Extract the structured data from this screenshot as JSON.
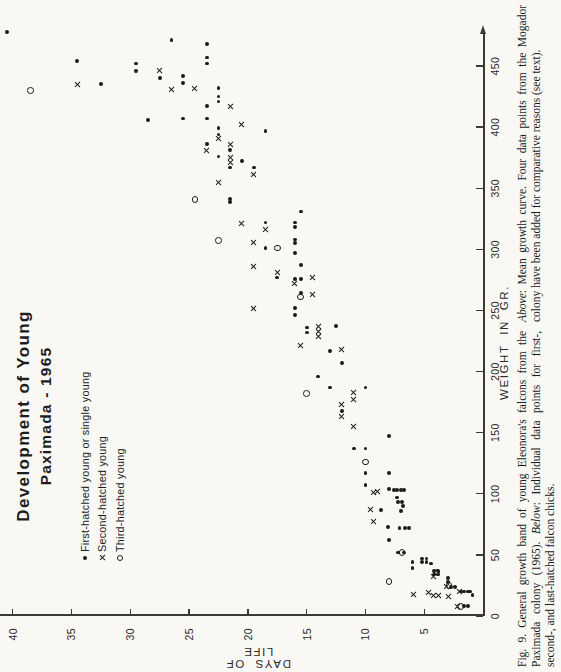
{
  "figure": {
    "title_line1": "Development of Young",
    "title_line2": "Paximada - 1965",
    "legend": [
      {
        "marker": "dot",
        "label": "First-hatched young or single young"
      },
      {
        "marker": "x",
        "label": "Second-hatched young"
      },
      {
        "marker": "circle",
        "label": "Third-hatched young"
      }
    ],
    "x_axis_label": "WEIGHT  IN  GR.",
    "y_axis_label": "DAYS  OF  LIFE"
  },
  "captions": {
    "left": [
      {
        "t": "Fig. 9. General growth band of young Eleonora's falcons from the Paximada colony (1965). ",
        "i": false
      },
      {
        "t": "Below",
        "i": true
      },
      {
        "t": ": Individual data points for first-, second-, and last-hatched falcon chicks.",
        "i": false
      }
    ],
    "right": [
      {
        "t": "Above",
        "i": true
      },
      {
        "t": ": Mean growth curve. Four data points from the Mogador colony have been added for comparative reasons (see text).",
        "i": false
      }
    ]
  },
  "chart_data": {
    "type": "scatter",
    "xlabel": "WEIGHT IN GR.",
    "ylabel": "DAYS OF LIFE",
    "xlim": [
      0,
      480
    ],
    "ylim": [
      0,
      41
    ],
    "x_ticks": [
      0,
      50,
      100,
      150,
      200,
      250,
      300,
      350,
      400,
      450
    ],
    "y_ticks": [
      5,
      10,
      15,
      20,
      25,
      30,
      35,
      40
    ],
    "grid": false,
    "legend_position": "upper-left",
    "layout_note": "figure printed rotated 90° counter-clockwise on the page; weight axis ends in an arrow",
    "axis_map": {
      "weight_px0": 56,
      "weight_px_per_unit": 1.2222,
      "days_px0": 483,
      "days_px_per_unit": 11.758
    },
    "marker_color": "#1c1c1c",
    "series": [
      {
        "name": "First-hatched young or single young",
        "marker": "dot",
        "points_weight_day": [
          [
            478,
            40.5
          ],
          [
            471,
            26.5
          ],
          [
            468,
            23.5
          ],
          [
            457,
            23.5
          ],
          [
            454,
            34.5
          ],
          [
            452,
            29.5
          ],
          [
            452,
            23.5
          ],
          [
            446,
            29.5
          ],
          [
            442,
            25.5
          ],
          [
            440,
            27.5
          ],
          [
            436,
            25.5
          ],
          [
            435,
            32.5
          ],
          [
            432,
            22.5
          ],
          [
            425,
            22.5
          ],
          [
            421,
            22.5
          ],
          [
            417,
            23.5
          ],
          [
            407,
            25.5
          ],
          [
            407,
            23.5
          ],
          [
            406,
            28.5
          ],
          [
            399,
            22.5
          ],
          [
            397,
            18.5
          ],
          [
            394,
            22.5
          ],
          [
            386,
            23.5
          ],
          [
            381,
            21.5
          ],
          [
            376,
            22.5
          ],
          [
            372,
            20.5
          ],
          [
            367,
            21.5
          ],
          [
            367,
            19.5
          ],
          [
            341,
            21.5
          ],
          [
            339,
            21.5
          ],
          [
            331,
            15.5
          ],
          [
            322,
            18.5
          ],
          [
            322,
            16
          ],
          [
            318,
            16
          ],
          [
            308,
            16
          ],
          [
            305,
            16
          ],
          [
            301,
            18.5
          ],
          [
            297,
            16
          ],
          [
            287,
            15.5
          ],
          [
            277,
            17.5
          ],
          [
            276,
            16
          ],
          [
            276,
            15.5
          ],
          [
            264,
            15.5
          ],
          [
            252,
            16
          ],
          [
            246,
            16
          ],
          [
            237,
            12.5
          ],
          [
            236,
            15
          ],
          [
            232,
            15
          ],
          [
            217,
            13
          ],
          [
            207,
            12
          ],
          [
            196,
            14
          ],
          [
            187,
            13
          ],
          [
            187,
            10
          ],
          [
            168,
            12
          ],
          [
            147,
            8
          ],
          [
            137,
            11
          ],
          [
            137,
            10
          ],
          [
            117,
            10
          ],
          [
            117,
            8
          ],
          [
            107,
            10
          ],
          [
            104,
            8
          ],
          [
            103,
            7.6
          ],
          [
            103,
            7.3
          ],
          [
            103,
            7
          ],
          [
            103,
            6.7
          ],
          [
            97,
            7.3
          ],
          [
            93,
            7.2
          ],
          [
            93,
            6.9
          ],
          [
            90,
            6.8
          ],
          [
            87,
            8.7
          ],
          [
            86,
            7
          ],
          [
            73,
            8.1
          ],
          [
            72,
            7.1
          ],
          [
            72,
            6.6
          ],
          [
            72,
            6.3
          ],
          [
            62,
            8
          ],
          [
            52,
            7.2
          ],
          [
            52,
            6.7
          ],
          [
            44,
            6
          ],
          [
            39,
            6
          ],
          [
            47,
            5.2
          ],
          [
            47,
            4.8
          ],
          [
            44,
            5.2
          ],
          [
            44,
            4.8
          ],
          [
            43,
            4.4
          ],
          [
            37,
            4.2
          ],
          [
            37,
            3.8
          ],
          [
            34,
            4.2
          ],
          [
            34,
            3.8
          ],
          [
            31,
            3
          ],
          [
            28,
            3
          ],
          [
            24,
            2.7
          ],
          [
            24,
            2.4
          ],
          [
            20,
            1.9
          ],
          [
            20,
            1.6
          ],
          [
            20,
            1.3
          ],
          [
            20,
            1.1
          ],
          [
            17,
            0.9
          ],
          [
            8,
            1.6
          ],
          [
            8,
            1.3
          ]
        ]
      },
      {
        "name": "Second-hatched young",
        "marker": "x",
        "points_weight_day": [
          [
            446,
            27.5
          ],
          [
            435,
            34.5
          ],
          [
            432,
            24.5
          ],
          [
            431,
            26.5
          ],
          [
            417,
            21.5
          ],
          [
            402,
            20.5
          ],
          [
            391,
            22.5
          ],
          [
            386,
            21.5
          ],
          [
            381,
            23.5
          ],
          [
            375,
            21.5
          ],
          [
            371,
            21.5
          ],
          [
            361,
            19.5
          ],
          [
            355,
            22.5
          ],
          [
            321,
            20.5
          ],
          [
            316,
            18.5
          ],
          [
            306,
            19.5
          ],
          [
            286,
            19.5
          ],
          [
            281,
            17.5
          ],
          [
            277,
            14.5
          ],
          [
            272,
            16
          ],
          [
            263,
            14.5
          ],
          [
            252,
            19.5
          ],
          [
            237,
            14
          ],
          [
            233,
            14
          ],
          [
            229,
            14
          ],
          [
            221,
            15.5
          ],
          [
            218,
            12
          ],
          [
            183,
            11
          ],
          [
            177,
            11
          ],
          [
            173,
            12
          ],
          [
            163,
            12
          ],
          [
            155,
            11
          ],
          [
            102,
            9
          ],
          [
            101,
            9.3
          ],
          [
            87,
            9.6
          ],
          [
            77,
            9.3
          ],
          [
            32,
            4.2
          ],
          [
            24,
            3.1
          ],
          [
            20,
            2
          ],
          [
            19,
            4.6
          ],
          [
            18,
            5.9
          ],
          [
            17,
            4.2
          ],
          [
            17,
            3.8
          ],
          [
            16,
            2.9
          ],
          [
            8,
            2.2
          ]
        ]
      },
      {
        "name": "Third-hatched young",
        "marker": "circle",
        "points_weight_day": [
          [
            430,
            38.5
          ],
          [
            341,
            24.5
          ],
          [
            307,
            22.5
          ],
          [
            301,
            17.5
          ],
          [
            261,
            15.5
          ],
          [
            182,
            15
          ],
          [
            126,
            10
          ],
          [
            52,
            6.9
          ],
          [
            36,
            3.9
          ],
          [
            28,
            8
          ],
          [
            25,
            2.9
          ],
          [
            8,
            1.9
          ]
        ]
      }
    ]
  }
}
